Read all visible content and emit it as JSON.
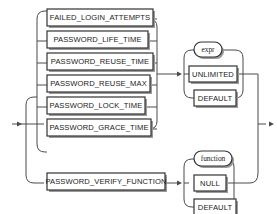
{
  "diagram": {
    "name": "password-parameters-syntax-diagram",
    "type": "railroad-syntax-diagram",
    "colors": {
      "background": "#ffffff",
      "line": "#4a4a4a",
      "box_border": "#333333",
      "box_fill": "#ffffff",
      "shadow": "#9a9a9a",
      "text": "#1a1a1a"
    },
    "entry_arrow": "entry-arrow",
    "exit_arrow": "exit-arrow",
    "parameter_branches": [
      {
        "label": "FAILED_LOGIN_ATTEMPTS",
        "shape": "rect"
      },
      {
        "label": "PASSWORD_LIFE_TIME",
        "shape": "rect"
      },
      {
        "label": "PASSWORD_REUSE_TIME",
        "shape": "rect"
      },
      {
        "label": "PASSWORD_REUSE_MAX",
        "shape": "rect"
      },
      {
        "label": "PASSWORD_LOCK_TIME",
        "shape": "rect"
      },
      {
        "label": "PASSWORD_GRACE_TIME",
        "shape": "rect"
      }
    ],
    "value_branches": [
      {
        "label": "expr",
        "shape": "oval"
      },
      {
        "label": "UNLIMITED",
        "shape": "rect"
      },
      {
        "label": "DEFAULT",
        "shape": "rect"
      }
    ],
    "function_parameter": {
      "label": "PASSWORD_VERIFY_FUNCTION",
      "shape": "rect"
    },
    "function_value_branches": [
      {
        "label": "function",
        "shape": "oval"
      },
      {
        "label": "NULL",
        "shape": "rect"
      },
      {
        "label": "DEFAULT",
        "shape": "rect"
      }
    ]
  }
}
